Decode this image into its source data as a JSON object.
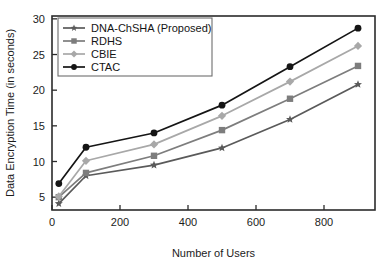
{
  "chart_data": {
    "type": "line",
    "title": "",
    "xlabel": "Number of Users",
    "ylabel": "Data Encryption Time (in seconds)",
    "x": [
      20,
      100,
      300,
      500,
      700,
      900
    ],
    "xlim": [
      0,
      950
    ],
    "ylim": [
      3.2,
      30.4
    ],
    "xticks": [
      0,
      200,
      400,
      600,
      800
    ],
    "yticks": [
      5,
      10,
      15,
      20,
      25,
      30
    ],
    "xtick_labels": [
      "0",
      "200",
      "400",
      "600",
      "800"
    ],
    "ytick_labels": [
      "5",
      "10",
      "15",
      "20",
      "25",
      "30"
    ],
    "grid": false,
    "legend_position": "upper-left-inside",
    "series": [
      {
        "name": "DNA-ChSHA (Proposed)",
        "values": [
          4.1,
          8.0,
          9.5,
          11.9,
          15.9,
          20.8
        ],
        "color": "#5a5a5a",
        "marker": "star"
      },
      {
        "name": "RDHS",
        "values": [
          5.0,
          8.4,
          10.8,
          14.4,
          18.8,
          23.4
        ],
        "color": "#7d7d7d",
        "marker": "square"
      },
      {
        "name": "CBIE",
        "values": [
          5.1,
          10.1,
          12.4,
          16.4,
          21.2,
          26.2
        ],
        "color": "#a8a8a8",
        "marker": "diamond"
      },
      {
        "name": "CTAC",
        "values": [
          6.9,
          12.0,
          14.0,
          17.9,
          23.3,
          28.7
        ],
        "color": "#151515",
        "marker": "circle"
      }
    ]
  }
}
